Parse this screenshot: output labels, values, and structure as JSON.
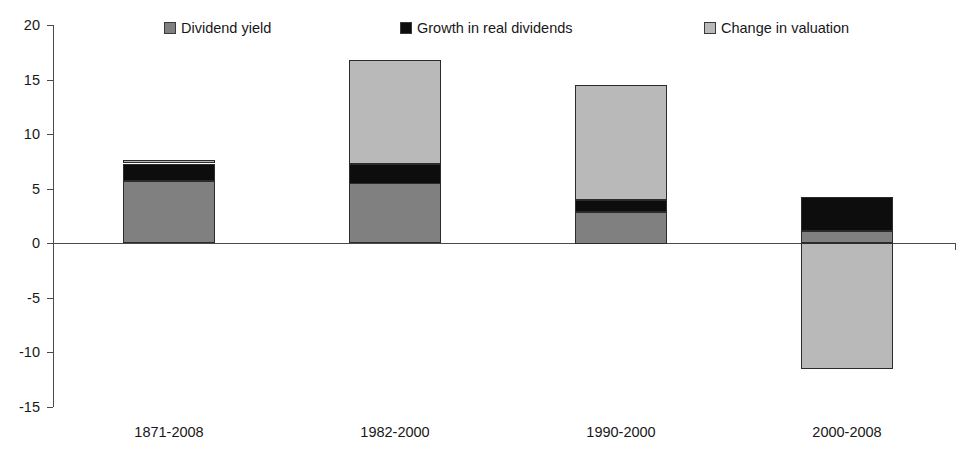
{
  "chart_data": {
    "type": "bar",
    "subtype": "stacked-bar",
    "title": "",
    "subtitle": "",
    "xlabel": "",
    "ylabel": "",
    "categories": [
      "1871-2008",
      "1982-2000",
      "1990-2000",
      "2000-2008"
    ],
    "series": [
      {
        "name": "Dividend yield",
        "color": "#808080",
        "values": [
          5.7,
          5.5,
          2.9,
          1.1
        ]
      },
      {
        "name": "Growth in real dividends",
        "color": "#0d0d0d",
        "values": [
          1.6,
          1.8,
          1.1,
          3.1
        ]
      },
      {
        "name": "Change in valuation",
        "color": "#b9b9b9",
        "values": [
          0.3,
          9.5,
          10.5,
          -11.5
        ]
      }
    ],
    "totals": [
      7.6,
      16.8,
      14.5,
      -7.3
    ],
    "ylim": [
      -15,
      20
    ],
    "yticks": [
      20,
      15,
      10,
      5,
      0,
      -5,
      -10,
      -15
    ],
    "ytick_labels": [
      "20",
      "15",
      "10",
      "5",
      "0",
      "-5",
      "-10",
      "-15"
    ],
    "grid": false,
    "legend_position": "top"
  },
  "legend": {
    "entries": [
      {
        "label": "Dividend yield",
        "color": "#808080"
      },
      {
        "label": "Growth in real dividends",
        "color": "#0d0d0d"
      },
      {
        "label": "Change in valuation",
        "color": "#b9b9b9"
      }
    ]
  },
  "axis": {
    "y_labels": [
      "20",
      "15",
      "10",
      "5",
      "0",
      "-5",
      "-10",
      "-15"
    ],
    "x_labels": [
      "1871-2008",
      "1982-2000",
      "1990-2000",
      "2000-2008"
    ]
  },
  "colors": {
    "axis": "#4a4a4a",
    "text": "#181818",
    "bar_outline": "#2b2b2b",
    "dividend_yield": "#808080",
    "growth_real_dividends": "#0d0d0d",
    "change_in_valuation": "#b9b9b9",
    "background": "#ffffff"
  }
}
